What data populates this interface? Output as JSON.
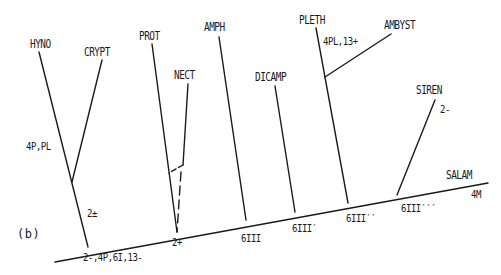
{
  "figure": {
    "panel_label": "(b)",
    "line_color": "#1a1a1a"
  },
  "taxa": {
    "hyno": "HYNO",
    "crypt": "CRYPT",
    "prot": "PROT",
    "nect": "NECT",
    "amph": "AMPH",
    "dicamp": "DICAMP",
    "pleth": "PLETH",
    "ambyst": "AMBYST",
    "siren": "SIREN",
    "salam": "SALAM"
  },
  "characters": {
    "hyno_crypt_branch": "4P,PL",
    "hyno_crypt_stem": "2±",
    "root_node": "2-,4P,6I,13-",
    "prot_nect_node": "2+",
    "amph_node": "6III",
    "dicamp_node": "6III′",
    "pleth_node": "6III′′",
    "siren_node": "6III′′′",
    "pleth_ambyst": "4PL,13+",
    "siren_branch": "2-",
    "salam_tip": "4M"
  }
}
